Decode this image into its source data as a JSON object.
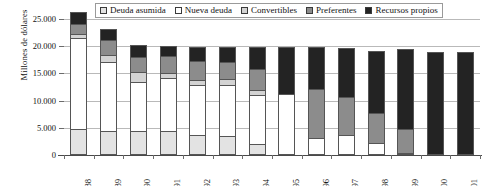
{
  "chart_data": {
    "type": "bar",
    "title": "",
    "xlabel": "",
    "ylabel": "Millones de dólares",
    "ylim": [
      0,
      25000
    ],
    "yticks": [
      0,
      5000,
      10000,
      15000,
      20000,
      25000
    ],
    "ytick_labels": [
      "0",
      "5.000",
      "10.000",
      "15.000",
      "20.000",
      "25.000"
    ],
    "grid": true,
    "stacked": true,
    "legend_position": "top",
    "categories": [
      "1988",
      "1989",
      "1990",
      "1991",
      "1992",
      "1993",
      "1994",
      "1995",
      "1996",
      "1997",
      "1998",
      "1999",
      "2000",
      "2001"
    ],
    "series": [
      {
        "name": "Deuda asumida",
        "color": "#e3e3e3",
        "values": [
          4700,
          4400,
          4500,
          4400,
          3600,
          3500,
          2100,
          0,
          0,
          0,
          0,
          0,
          0,
          0
        ]
      },
      {
        "name": "Nueva deuda",
        "color": "#ffffff",
        "values": [
          16900,
          12700,
          9000,
          9800,
          9200,
          9400,
          8900,
          11200,
          3100,
          3600,
          2300,
          300,
          0,
          0
        ]
      },
      {
        "name": "Convertibles",
        "color": "#d3d3d3",
        "values": [
          600,
          1300,
          1700,
          800,
          900,
          1100,
          900,
          0,
          0,
          0,
          0,
          0,
          0,
          0
        ]
      },
      {
        "name": "Preferentes",
        "color": "#8c8c8c",
        "values": [
          1900,
          2700,
          2800,
          3200,
          3600,
          3100,
          4000,
          0,
          9100,
          7000,
          5400,
          4500,
          0,
          0
        ]
      },
      {
        "name": "Recursos propios",
        "color": "#232323",
        "values": [
          2200,
          2000,
          2200,
          1900,
          2600,
          2800,
          3900,
          8700,
          7700,
          9000,
          11400,
          14700,
          19000,
          18900
        ]
      }
    ],
    "totals": [
      26300,
      23100,
      20200,
      20100,
      19900,
      19900,
      19800,
      19900,
      19900,
      19600,
      19100,
      19500,
      19000,
      18900
    ]
  },
  "legend": {
    "items": [
      {
        "label": "Deuda asumida"
      },
      {
        "label": "Nueva deuda"
      },
      {
        "label": "Convertibles"
      },
      {
        "label": "Preferentes"
      },
      {
        "label": "Recursos propios"
      }
    ]
  }
}
